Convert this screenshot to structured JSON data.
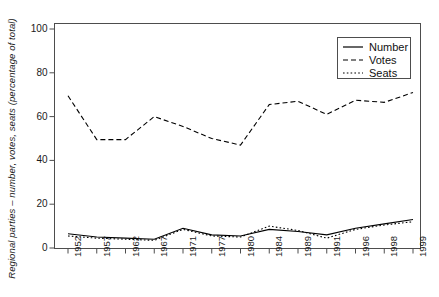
{
  "chart_data": {
    "type": "line",
    "title": "",
    "xlabel": "",
    "ylabel": "Regional parties – number, votes, seats (percentage of total)",
    "categories": [
      "1952",
      "1957",
      "1962",
      "1967",
      "1971",
      "1977",
      "1980",
      "1984",
      "1989",
      "1991",
      "1996",
      "1998",
      "1999"
    ],
    "x": [
      1952,
      1957,
      1962,
      1967,
      1971,
      1977,
      1980,
      1984,
      1989,
      1991,
      1996,
      1998,
      1999
    ],
    "ylim": [
      0,
      104
    ],
    "yticks": [
      0,
      20,
      40,
      60,
      80,
      100
    ],
    "ytick_labels": [
      "0",
      "20",
      "40",
      "60",
      "80",
      "100"
    ],
    "grid": false,
    "legend_position": "top-right",
    "series": [
      {
        "name": "Number",
        "style": "solid",
        "color": "#000000",
        "values": [
          6.5,
          5.0,
          4.5,
          4.0,
          9.0,
          6.0,
          5.5,
          8.5,
          7.5,
          6.0,
          9.0,
          11.0,
          13.0
        ]
      },
      {
        "name": "Votes",
        "style": "dashed",
        "color": "#000000",
        "values": [
          69.5,
          49.5,
          49.5,
          60.0,
          55.5,
          50.0,
          47.0,
          65.5,
          67.0,
          61.0,
          67.5,
          66.5,
          71.0
        ]
      },
      {
        "name": "Seats",
        "style": "dotted",
        "color": "#000000",
        "values": [
          5.5,
          4.5,
          4.0,
          3.5,
          8.5,
          5.5,
          5.0,
          10.0,
          8.0,
          4.5,
          8.5,
          10.5,
          12.0
        ]
      }
    ]
  },
  "legend": {
    "entries": [
      {
        "label": "Number",
        "style": "solid"
      },
      {
        "label": "Votes",
        "style": "dashed"
      },
      {
        "label": "Seats",
        "style": "dotted"
      }
    ]
  }
}
